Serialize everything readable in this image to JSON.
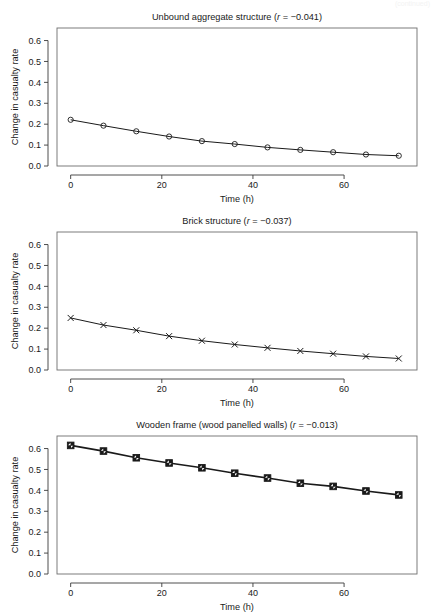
{
  "figure": {
    "background": "#ffffff",
    "foreground": "#1a1a1a",
    "box_color": "#6e6e6e",
    "width": 436,
    "height": 612,
    "partial_header_text": "(continued)"
  },
  "chart_data": [
    {
      "type": "line",
      "panel_index": 0,
      "title": "Unbound aggregate structure (r = −0.041)",
      "title_prefix": "Unbound aggregate structure (",
      "title_italic": "r",
      "title_suffix": " = −0.041)",
      "xlabel": "Time (h)",
      "ylabel": "Change in casualty rate",
      "xlim": [
        -3,
        76
      ],
      "ylim": [
        0.0,
        0.66
      ],
      "xticks": [
        0,
        20,
        40,
        60
      ],
      "xticklabels": [
        "0",
        "20",
        "40",
        "60"
      ],
      "yticks": [
        0.0,
        0.1,
        0.2,
        0.3,
        0.4,
        0.5,
        0.6
      ],
      "yticklabels": [
        "0.0",
        "0.1",
        "0.2",
        "0.3",
        "0.4",
        "0.5",
        "0.6"
      ],
      "grid": false,
      "legend": null,
      "marker": "open-circle",
      "x": [
        0,
        7.2,
        14.4,
        21.6,
        28.8,
        36,
        43.2,
        50.4,
        57.6,
        64.8,
        72
      ],
      "values": [
        0.221,
        0.193,
        0.166,
        0.141,
        0.119,
        0.105,
        0.089,
        0.077,
        0.066,
        0.055,
        0.049
      ]
    },
    {
      "type": "line",
      "panel_index": 1,
      "title": "Brick structure (r = −0.037)",
      "title_prefix": "Brick structure (",
      "title_italic": "r",
      "title_suffix": " = −0.037)",
      "xlabel": "Time (h)",
      "ylabel": "Change in casualty rate",
      "xlim": [
        -3,
        76
      ],
      "ylim": [
        0.0,
        0.66
      ],
      "xticks": [
        0,
        20,
        40,
        60
      ],
      "xticklabels": [
        "0",
        "20",
        "40",
        "60"
      ],
      "yticks": [
        0.0,
        0.1,
        0.2,
        0.3,
        0.4,
        0.5,
        0.6
      ],
      "yticklabels": [
        "0.0",
        "0.1",
        "0.2",
        "0.3",
        "0.4",
        "0.5",
        "0.6"
      ],
      "grid": false,
      "legend": null,
      "marker": "x-cross",
      "x": [
        0,
        7.2,
        14.4,
        21.6,
        28.8,
        36,
        43.2,
        50.4,
        57.6,
        64.8,
        72
      ],
      "values": [
        0.249,
        0.215,
        0.19,
        0.162,
        0.14,
        0.122,
        0.106,
        0.091,
        0.078,
        0.065,
        0.055
      ]
    },
    {
      "type": "line",
      "panel_index": 2,
      "title": "Wooden frame (wood panelled walls) (r = −0.013)",
      "title_prefix": "Wooden frame (wood panelled walls) (",
      "title_italic": "r",
      "title_suffix": " = −0.013)",
      "xlabel": "Time (h)",
      "ylabel": "Change in casualty rate",
      "xlim": [
        -3,
        76
      ],
      "ylim": [
        0.0,
        0.66
      ],
      "xticks": [
        0,
        20,
        40,
        60
      ],
      "xticklabels": [
        "0",
        "20",
        "40",
        "60"
      ],
      "yticks": [
        0.0,
        0.1,
        0.2,
        0.3,
        0.4,
        0.5,
        0.6
      ],
      "yticklabels": [
        "0.0",
        "0.1",
        "0.2",
        "0.3",
        "0.4",
        "0.5",
        "0.6"
      ],
      "grid": false,
      "legend": null,
      "marker": "filled-square",
      "x": [
        0,
        7.2,
        14.4,
        21.6,
        28.8,
        36,
        43.2,
        50.4,
        57.6,
        64.8,
        72
      ],
      "values": [
        0.615,
        0.588,
        0.556,
        0.531,
        0.508,
        0.482,
        0.459,
        0.434,
        0.419,
        0.397,
        0.378
      ]
    }
  ]
}
